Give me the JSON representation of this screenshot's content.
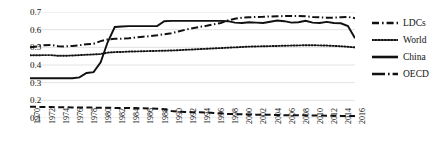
{
  "chart_data": {
    "type": "line",
    "title": "",
    "xlabel": "",
    "ylabel": "",
    "xlim": [
      1970,
      2016
    ],
    "ylim": [
      0.1,
      0.7
    ],
    "yticks": [
      0.1,
      0.2,
      0.3,
      0.4,
      0.5,
      0.6,
      0.7
    ],
    "ytick_labels": [
      "0.1",
      "0.2",
      "0.3",
      "0.4",
      "0.5",
      "0.6",
      "0.7"
    ],
    "grid": true,
    "grid_axis": "y",
    "legend_position": "right",
    "x": [
      1970,
      1971,
      1972,
      1973,
      1974,
      1975,
      1976,
      1977,
      1978,
      1979,
      1980,
      1981,
      1982,
      1983,
      1984,
      1985,
      1986,
      1987,
      1988,
      1989,
      1990,
      1991,
      1992,
      1993,
      1994,
      1995,
      1996,
      1997,
      1998,
      1999,
      2000,
      2001,
      2002,
      2003,
      2004,
      2005,
      2006,
      2007,
      2008,
      2009,
      2010,
      2011,
      2012,
      2013,
      2014,
      2015,
      2016
    ],
    "xtick_labels": [
      "1970",
      "1972",
      "1974",
      "1976",
      "1978",
      "1980",
      "1982",
      "1984",
      "1986",
      "1988",
      "1990",
      "1992",
      "1994",
      "1996",
      "1998",
      "2000",
      "2002",
      "2004",
      "2006",
      "2008",
      "2010",
      "2012",
      "2014",
      "2016"
    ],
    "series": [
      {
        "name": "LDCs",
        "style": "dashed",
        "color": "#111111",
        "values": [
          0.163,
          0.163,
          0.162,
          0.162,
          0.161,
          0.161,
          0.16,
          0.16,
          0.159,
          0.159,
          0.158,
          0.158,
          0.157,
          0.157,
          0.156,
          0.156,
          0.155,
          0.154,
          0.152,
          0.15,
          0.14,
          0.136,
          0.134,
          0.133,
          0.132,
          0.131,
          0.129,
          0.126,
          0.123,
          0.122,
          0.121,
          0.12,
          0.119,
          0.118,
          0.118,
          0.117,
          0.116,
          0.116,
          0.115,
          0.115,
          0.114,
          0.114,
          0.113,
          0.113,
          0.112,
          0.112,
          0.112
        ]
      },
      {
        "name": "World",
        "style": "dotted",
        "color": "#111111",
        "values": [
          0.455,
          0.455,
          0.456,
          0.456,
          0.452,
          0.452,
          0.454,
          0.456,
          0.458,
          0.46,
          0.462,
          0.47,
          0.473,
          0.474,
          0.476,
          0.477,
          0.478,
          0.479,
          0.48,
          0.481,
          0.482,
          0.484,
          0.486,
          0.488,
          0.49,
          0.492,
          0.494,
          0.496,
          0.498,
          0.5,
          0.502,
          0.504,
          0.505,
          0.506,
          0.507,
          0.508,
          0.509,
          0.51,
          0.511,
          0.512,
          0.512,
          0.511,
          0.51,
          0.508,
          0.506,
          0.503,
          0.5
        ]
      },
      {
        "name": "China",
        "style": "solid",
        "color": "#111111",
        "values": [
          0.325,
          0.325,
          0.325,
          0.325,
          0.325,
          0.325,
          0.325,
          0.33,
          0.355,
          0.36,
          0.415,
          0.53,
          0.615,
          0.618,
          0.62,
          0.62,
          0.62,
          0.62,
          0.62,
          0.648,
          0.65,
          0.65,
          0.65,
          0.65,
          0.65,
          0.65,
          0.65,
          0.65,
          0.648,
          0.64,
          0.638,
          0.642,
          0.64,
          0.638,
          0.645,
          0.652,
          0.648,
          0.64,
          0.642,
          0.65,
          0.64,
          0.638,
          0.644,
          0.638,
          0.636,
          0.62,
          0.552
        ]
      },
      {
        "name": "OECD",
        "style": "dashdot",
        "color": "#111111",
        "values": [
          0.5,
          0.505,
          0.512,
          0.513,
          0.506,
          0.505,
          0.508,
          0.512,
          0.518,
          0.52,
          0.535,
          0.545,
          0.548,
          0.549,
          0.551,
          0.556,
          0.56,
          0.563,
          0.568,
          0.574,
          0.58,
          0.59,
          0.6,
          0.608,
          0.615,
          0.622,
          0.63,
          0.638,
          0.652,
          0.662,
          0.668,
          0.67,
          0.672,
          0.673,
          0.675,
          0.676,
          0.677,
          0.678,
          0.678,
          0.676,
          0.672,
          0.67,
          0.668,
          0.668,
          0.67,
          0.672,
          0.665
        ]
      }
    ]
  },
  "legend": {
    "items": [
      {
        "label": "LDCs",
        "key": "dashed-dot-key"
      },
      {
        "label": "World",
        "key": "dotted-key"
      },
      {
        "label": "China",
        "key": "solid-key"
      },
      {
        "label": "OECD",
        "key": "dashdot-key"
      }
    ]
  },
  "colors": {
    "line": "#111111",
    "grid": "#e3e3e3",
    "background": "#ffffff"
  }
}
